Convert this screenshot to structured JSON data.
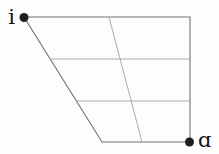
{
  "diagram": {
    "type": "vowel-quadrilateral",
    "width": 219,
    "height": 154,
    "background": "#fdfdfd",
    "colors": {
      "outline": "#747474",
      "grid": "#a3a3a3",
      "dot": "#1f1f1f",
      "label": "#141414"
    },
    "outline": [
      [
        24,
        17
      ],
      [
        190,
        17
      ],
      [
        190,
        142
      ],
      [
        102,
        142
      ]
    ],
    "grid_lines": [
      {
        "name": "row-divider-upper",
        "x1": 50,
        "y1": 59,
        "x2": 190,
        "y2": 59
      },
      {
        "name": "row-divider-lower",
        "x1": 76,
        "y1": 101,
        "x2": 190,
        "y2": 101
      },
      {
        "name": "column-divider-central",
        "x1": 109,
        "y1": 17,
        "x2": 142,
        "y2": 142
      }
    ],
    "vertices": [
      {
        "id": "i",
        "label": "i",
        "dot_x": 24,
        "dot_y": 17.5,
        "dot_radius": 4.5,
        "label_x": 15,
        "label_y": 24,
        "label_anchor": "end"
      },
      {
        "id": "alpha",
        "label": "ɑ",
        "dot_x": 189.5,
        "dot_y": 142,
        "dot_radius": 4.5,
        "label_x": 198,
        "label_y": 146.5,
        "label_anchor": "start"
      }
    ]
  }
}
